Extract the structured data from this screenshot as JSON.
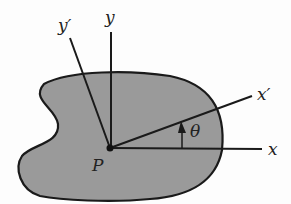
{
  "diagram": {
    "point_label": "P",
    "axes": {
      "x": "x",
      "y": "y",
      "x_prime": "x′",
      "y_prime": "y′"
    },
    "angle_label": "θ",
    "colors": {
      "region_fill": "#9a9a9a",
      "outline": "#1a1a1a",
      "background": "#fdfdfd"
    }
  }
}
